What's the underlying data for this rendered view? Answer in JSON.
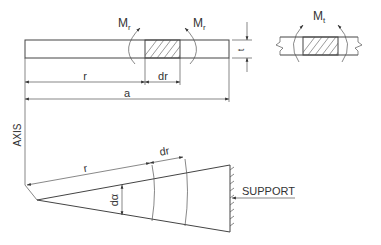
{
  "diagram": {
    "top_view": {
      "moment_left_label": "M",
      "moment_left_sub": "r",
      "moment_right_label": "M",
      "moment_right_sub": "r",
      "thickness_label": "t",
      "radius_label": "r",
      "increment_label": "dr",
      "outer_radius_label": "a"
    },
    "detail_view": {
      "moment_label": "M",
      "moment_sub": "t"
    },
    "plan_view": {
      "axis_label": "AXIS",
      "radius_label": "r",
      "increment_label": "dr",
      "angle_label": "dα",
      "support_label": "SUPPORT"
    },
    "colors": {
      "line": "#444444",
      "background": "#ffffff"
    }
  }
}
